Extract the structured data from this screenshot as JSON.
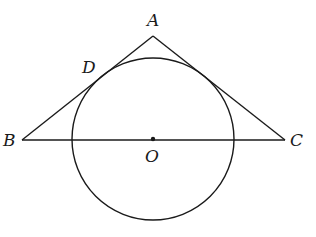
{
  "diagram": {
    "type": "geometry",
    "colors": {
      "stroke": "#1a1a1a",
      "background": "#ffffff"
    },
    "points": {
      "A": {
        "label": "A",
        "x": 153,
        "y": 36
      },
      "B": {
        "label": "B",
        "x": 22,
        "y": 140
      },
      "C": {
        "label": "C",
        "x": 285,
        "y": 140
      },
      "O": {
        "label": "O",
        "x": 153,
        "y": 139
      },
      "D": {
        "label": "D",
        "x": 101,
        "y": 77
      }
    },
    "circle": {
      "center": "O",
      "cx": 153,
      "cy": 139,
      "r": 81
    },
    "segments": [
      "AB",
      "AC",
      "BC"
    ],
    "labels": {
      "A": "A",
      "B": "B",
      "C": "C",
      "O": "O",
      "D": "D"
    }
  }
}
